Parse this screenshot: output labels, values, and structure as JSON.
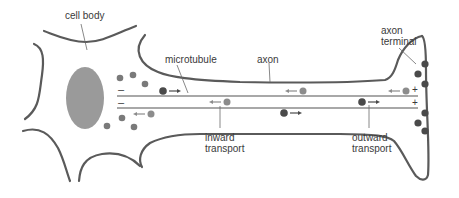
{
  "diagram": {
    "labels": {
      "cell_body": "cell body",
      "microtubule": "microtubule",
      "axon": "axon",
      "axon_terminal": "axon\nterminal",
      "inward_transport": "inward\ntransport",
      "outward_transport": "outward\ntransport"
    },
    "polarity": {
      "minus_end": "–",
      "plus_end": "+"
    },
    "colors": {
      "membrane": "#5a5a5a",
      "nucleus": "#9a9a9a",
      "microtubule": "#a8a8a8",
      "vesicle_outward": "#4a4a4a",
      "vesicle_inward": "#8c8c8c",
      "vesicle_cytoplasm": "#7a7a7a",
      "label_text": "#3a3a3a"
    }
  }
}
